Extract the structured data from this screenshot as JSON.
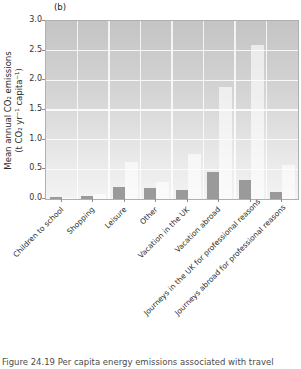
{
  "figure": {
    "panel_label": "(b)",
    "caption": "Figure 24.19 Per capita energy emissions associated with travel"
  },
  "chart_data": {
    "type": "bar",
    "title": "(b)",
    "ylabel_line1": "Mean annual CO₂ emissions",
    "ylabel_line2": "(t CO₂ yr⁻¹ capita⁻¹)",
    "xlabel": "",
    "ylim": [
      0,
      3.0
    ],
    "ytick_values": [
      0,
      0.5,
      1.0,
      1.5,
      2.0,
      2.5,
      3.0
    ],
    "ytick_labels": [
      "0.0",
      "0.5",
      "1.0",
      "1.5",
      "2.0",
      "2.5",
      "3.0"
    ],
    "grid": true,
    "legend_position": "none",
    "categories": [
      "Children to school",
      "Shopping",
      "Leisure",
      "Other",
      "Vacation in the UK",
      "Vacation abroad",
      "Journeys in the UK for professional reasons",
      "Journeys abroad for professional reasons"
    ],
    "series": [
      {
        "name": "dark-gray-bars",
        "color": "#9a9a9a",
        "values": [
          0.03,
          0.05,
          0.21,
          0.19,
          0.16,
          0.46,
          0.32,
          0.12
        ]
      },
      {
        "name": "light-gray-bars",
        "color": "#ececec",
        "values": [
          0.01,
          0.08,
          0.62,
          0.29,
          0.76,
          1.88,
          2.6,
          0.58
        ]
      }
    ]
  },
  "style": {
    "plot_bg_top": "#c4c4c4",
    "plot_bg_bottom": "#f3f3f3",
    "gridline_color": "#ffffff",
    "axis_color": "#b0b0b0",
    "text_color": "#2e2e2e"
  }
}
